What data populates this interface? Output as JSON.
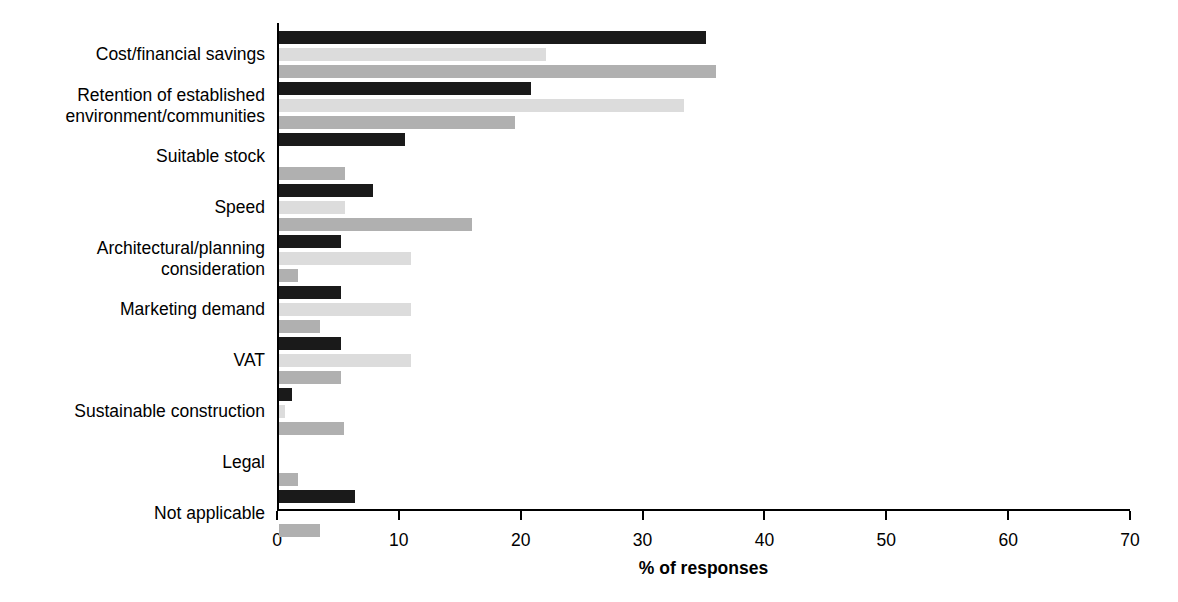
{
  "chart_data": {
    "type": "bar",
    "orientation": "horizontal",
    "title": "",
    "xlabel": "% of responses",
    "ylabel": "",
    "xlim": [
      0,
      70
    ],
    "xticks": [
      0,
      10,
      20,
      30,
      40,
      50,
      60,
      70
    ],
    "grid": false,
    "legend": "none",
    "categories": [
      "Cost/financial savings",
      "Retention of established\nenvironment/communities",
      "Suitable stock",
      "Speed",
      "Architectural/planning\nconsideration",
      "Marketing demand",
      "VAT",
      "Sustainable construction",
      "Legal",
      "Not applicable"
    ],
    "series": [
      {
        "name": "series-1",
        "color": "#1a1a1a",
        "values": [
          35.0,
          20.7,
          10.3,
          7.7,
          5.1,
          5.1,
          5.1,
          1.1,
          0,
          6.2
        ]
      },
      {
        "name": "series-2",
        "color": "#dcdcdc",
        "values": [
          21.9,
          33.2,
          0,
          5.4,
          10.8,
          10.8,
          10.8,
          0.5,
          0,
          0
        ]
      },
      {
        "name": "series-3",
        "color": "#b0b0b0",
        "values": [
          35.9,
          19.4,
          5.4,
          15.8,
          1.6,
          3.4,
          5.1,
          5.3,
          1.6,
          3.4
        ]
      }
    ]
  },
  "axis": {
    "tick_labels": [
      "0",
      "10",
      "20",
      "30",
      "40",
      "50",
      "60",
      "70"
    ],
    "x_axis_title": "% of responses"
  }
}
